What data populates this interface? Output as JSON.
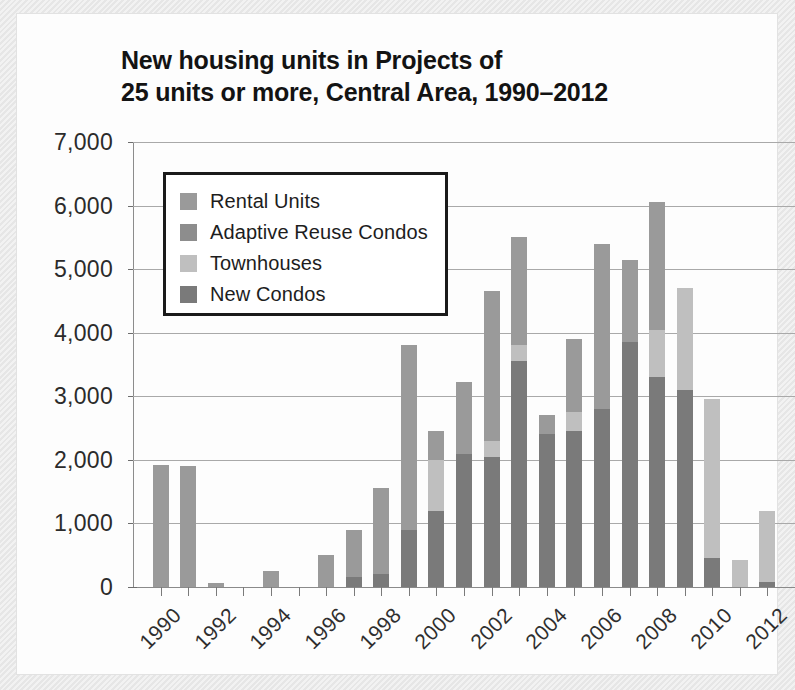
{
  "title": {
    "line1": "New housing units in Projects of",
    "line2": "25 units or more, Central Area, 1990–2012"
  },
  "legend": {
    "position": "inside-top-left",
    "items": [
      {
        "label": "Rental Units",
        "color": "#9a9a9a"
      },
      {
        "label": "Adaptive Reuse Condos",
        "color": "#8d8d8d"
      },
      {
        "label": "Townhouses",
        "color": "#bfbfbf"
      },
      {
        "label": "New Condos",
        "color": "#7a7a7a"
      }
    ]
  },
  "chart_data": {
    "type": "bar",
    "stacked": true,
    "title": "New housing units in Projects of 25 units or more, Central Area, 1990–2012",
    "xlabel": "",
    "ylabel": "",
    "ylim": [
      0,
      7000
    ],
    "ytick_values": [
      7000,
      6000,
      5000,
      4000,
      3000,
      2000,
      1000,
      0
    ],
    "ytick_labels": [
      "7,000",
      "6,000",
      "5,000",
      "4,000",
      "3,000",
      "2,000",
      "1,000",
      "0"
    ],
    "grid": true,
    "categories": [
      "1990",
      "1991",
      "1992",
      "1993",
      "1994",
      "1995",
      "1996",
      "1997",
      "1998",
      "1999",
      "2000",
      "2001",
      "2002",
      "2003",
      "2004",
      "2005",
      "2006",
      "2007",
      "2008",
      "2009",
      "2010",
      "2011",
      "2012"
    ],
    "xtick_labels": [
      "1990",
      "1992",
      "1994",
      "1996",
      "1998",
      "2000",
      "2002",
      "2004",
      "2006",
      "2008",
      "2010",
      "2012"
    ],
    "series": [
      {
        "name": "New Condos",
        "color": "#7a7a7a",
        "values": [
          0,
          0,
          0,
          0,
          0,
          0,
          0,
          150,
          200,
          900,
          1200,
          2100,
          2050,
          3550,
          2400,
          2450,
          2800,
          3850,
          3300,
          3100,
          450,
          0,
          80
        ]
      },
      {
        "name": "Townhouses",
        "color": "#bfbfbf",
        "values": [
          0,
          0,
          0,
          0,
          0,
          0,
          0,
          0,
          0,
          0,
          800,
          0,
          250,
          250,
          0,
          300,
          0,
          0,
          750,
          1600,
          2500,
          430,
          1120
        ]
      },
      {
        "name": "Adaptive Reuse Condos",
        "color": "#8d8d8d",
        "values": [
          0,
          0,
          0,
          0,
          0,
          0,
          0,
          0,
          0,
          0,
          0,
          0,
          0,
          0,
          0,
          0,
          0,
          0,
          0,
          0,
          0,
          0,
          0
        ]
      },
      {
        "name": "Rental Units",
        "color": "#9a9a9a",
        "values": [
          1920,
          1910,
          70,
          0,
          250,
          0,
          500,
          750,
          1350,
          2900,
          450,
          1120,
          2350,
          1700,
          300,
          1150,
          2600,
          1300,
          2000,
          0,
          0,
          0,
          0
        ]
      }
    ],
    "totals": [
      1920,
      1910,
      70,
      0,
      250,
      0,
      500,
      900,
      1550,
      3800,
      2450,
      3220,
      4650,
      5500,
      2700,
      3900,
      5400,
      5150,
      6050,
      4700,
      2950,
      430,
      1200
    ]
  }
}
